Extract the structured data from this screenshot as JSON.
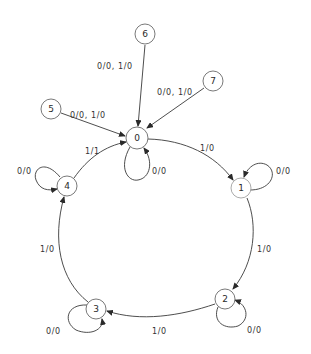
{
  "diagram": {
    "type": "finite-state-machine",
    "states": [
      {
        "id": "0",
        "label": "0",
        "x": 137,
        "y": 138
      },
      {
        "id": "1",
        "label": "1",
        "x": 241,
        "y": 188
      },
      {
        "id": "2",
        "label": "2",
        "x": 225,
        "y": 299
      },
      {
        "id": "3",
        "label": "3",
        "x": 96,
        "y": 309
      },
      {
        "id": "4",
        "label": "4",
        "x": 67,
        "y": 186
      },
      {
        "id": "5",
        "label": "5",
        "x": 51,
        "y": 109
      },
      {
        "id": "6",
        "label": "6",
        "x": 145,
        "y": 34
      },
      {
        "id": "7",
        "label": "7",
        "x": 213,
        "y": 81
      }
    ],
    "transitions": [
      {
        "from": "0",
        "to": "0",
        "label": "0/0"
      },
      {
        "from": "0",
        "to": "1",
        "label": "1/0"
      },
      {
        "from": "1",
        "to": "1",
        "label": "0/0"
      },
      {
        "from": "1",
        "to": "2",
        "label": "1/0"
      },
      {
        "from": "2",
        "to": "2",
        "label": "0/0"
      },
      {
        "from": "2",
        "to": "3",
        "label": "1/0"
      },
      {
        "from": "3",
        "to": "3",
        "label": "0/0"
      },
      {
        "from": "3",
        "to": "4",
        "label": "1/0"
      },
      {
        "from": "4",
        "to": "4",
        "label": "0/0"
      },
      {
        "from": "4",
        "to": "0",
        "label": "1/1"
      },
      {
        "from": "5",
        "to": "0",
        "label": "0/0, 1/0"
      },
      {
        "from": "6",
        "to": "0",
        "label": "0/0, 1/0"
      },
      {
        "from": "7",
        "to": "0",
        "label": "0/0, 1/0"
      }
    ]
  },
  "labels": {
    "s0": "0",
    "s1": "1",
    "s2": "2",
    "s3": "3",
    "s4": "4",
    "s5": "5",
    "s6": "6",
    "s7": "7",
    "e00": "0/0",
    "e01": "1/0",
    "e11": "0/0",
    "e12": "1/0",
    "e22": "0/0",
    "e23": "1/0",
    "e33": "0/0",
    "e34": "1/0",
    "e44": "0/0",
    "e40": "1/1",
    "e50": "0/0, 1/0",
    "e60": "0/0, 1/0",
    "e70": "0/0, 1/0"
  }
}
